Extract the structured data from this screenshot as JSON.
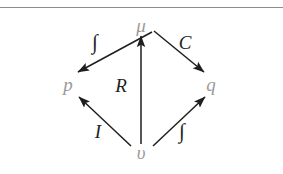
{
  "figure": {
    "background_color": "#ffffff",
    "rule": {
      "y": 7,
      "color": "#8c8c8c"
    },
    "node_color": "#9a9a9a",
    "edge_color": "#1f1f1f",
    "arrow_color": "#1f1f1f",
    "nodes": [
      {
        "id": "mu",
        "label": "μ",
        "x": 141,
        "y": 25,
        "name": "node-mu"
      },
      {
        "id": "p",
        "label": "p",
        "x": 68,
        "y": 84,
        "name": "node-p"
      },
      {
        "id": "q",
        "label": "q",
        "x": 211,
        "y": 84,
        "name": "node-q"
      },
      {
        "id": "upsilon",
        "label": "υ",
        "x": 141,
        "y": 152,
        "name": "node-upsilon"
      }
    ],
    "edges": [
      {
        "id": "mu-to-p",
        "from": "mu",
        "to": "p",
        "label": "∫",
        "label_x": 95,
        "label_y": 42,
        "name": "arrow-mu-to-p"
      },
      {
        "id": "mu-to-q",
        "from": "mu",
        "to": "q",
        "label": "C",
        "label_x": 185,
        "label_y": 42,
        "name": "arrow-mu-to-q"
      },
      {
        "id": "upsilon-to-mu",
        "from": "upsilon",
        "to": "mu",
        "label": "R",
        "label_x": 121,
        "label_y": 85,
        "name": "arrow-upsilon-to-mu"
      },
      {
        "id": "upsilon-to-p",
        "from": "upsilon",
        "to": "p",
        "label": "I",
        "label_x": 98,
        "label_y": 131,
        "name": "arrow-upsilon-to-p"
      },
      {
        "id": "upsilon-to-q",
        "from": "upsilon",
        "to": "q",
        "label": "∫",
        "label_x": 182,
        "label_y": 131,
        "name": "arrow-upsilon-to-q"
      }
    ],
    "edge_paths": {
      "mu-to-p": {
        "x1": 152,
        "y1": 32,
        "x2": 78,
        "y2": 72
      },
      "mu-to-q": {
        "x1": 154,
        "y1": 31,
        "x2": 204,
        "y2": 72
      },
      "upsilon-to-mu": {
        "x1": 141,
        "y1": 144,
        "x2": 141,
        "y2": 36
      },
      "upsilon-to-p": {
        "x1": 131,
        "y1": 146,
        "x2": 79,
        "y2": 97
      },
      "upsilon-to-q": {
        "x1": 153,
        "y1": 146,
        "x2": 205,
        "y2": 97
      }
    }
  }
}
